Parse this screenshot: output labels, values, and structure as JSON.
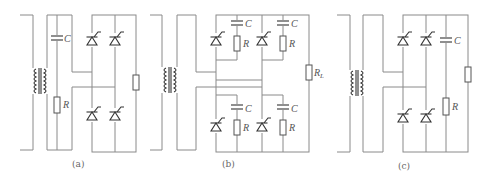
{
  "figure": {
    "panels": [
      {
        "id": "a",
        "caption": "(a)",
        "components": {
          "capacitor_label": "C",
          "resistor_label": "R"
        },
        "thyristor_count": 4
      },
      {
        "id": "b",
        "caption": "(b)",
        "components": {
          "capacitor_labels": [
            "C",
            "C",
            "C",
            "C"
          ],
          "resistor_labels": [
            "R",
            "R",
            "R",
            "R"
          ],
          "load_label": "R",
          "load_subscript": "L"
        },
        "thyristor_count": 4
      },
      {
        "id": "c",
        "caption": "(c)",
        "components": {
          "capacitor_label": "C",
          "resistor_label": "R"
        },
        "thyristor_count": 4
      }
    ]
  },
  "colors": {
    "wire": "#8a8a8a",
    "component": "#555555",
    "text": "#555555",
    "background": "#ffffff"
  }
}
